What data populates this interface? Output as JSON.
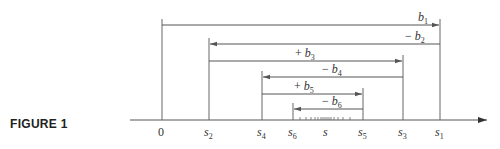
{
  "figure": {
    "label": "FIGURE 1"
  },
  "axis": {
    "points": [
      {
        "id": "0",
        "label": "0",
        "x": 162
      },
      {
        "id": "s2",
        "label": "s",
        "sub": "2",
        "x": 209
      },
      {
        "id": "s4",
        "label": "s",
        "sub": "4",
        "x": 262
      },
      {
        "id": "s6",
        "label": "s",
        "sub": "6",
        "x": 293
      },
      {
        "id": "s",
        "label": "s",
        "sub": "",
        "x": 326
      },
      {
        "id": "s5",
        "label": "s",
        "sub": "5",
        "x": 363
      },
      {
        "id": "s3",
        "label": "s",
        "sub": "3",
        "x": 403
      },
      {
        "id": "s1",
        "label": "s",
        "sub": "1",
        "x": 440
      }
    ]
  },
  "arrows": [
    {
      "id": "b1",
      "sign": "",
      "label": "b",
      "sub": "1",
      "from": "0",
      "to": "s1",
      "y": 25
    },
    {
      "id": "b2",
      "sign": "− ",
      "label": "b",
      "sub": "2",
      "from": "s1",
      "to": "s2",
      "y": 44
    },
    {
      "id": "b3",
      "sign": "+ ",
      "label": "b",
      "sub": "3",
      "from": "s2",
      "to": "s3",
      "y": 61
    },
    {
      "id": "b4",
      "sign": "− ",
      "label": "b",
      "sub": "4",
      "from": "s3",
      "to": "s4",
      "y": 77
    },
    {
      "id": "b5",
      "sign": "+ ",
      "label": "b",
      "sub": "5",
      "from": "s4",
      "to": "s5",
      "y": 94
    },
    {
      "id": "b6",
      "sign": "− ",
      "label": "b",
      "sub": "6",
      "from": "s5",
      "to": "s6",
      "y": 109
    }
  ],
  "colors": {
    "line": "#555555",
    "text": "#333333"
  }
}
